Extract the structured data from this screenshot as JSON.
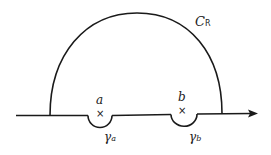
{
  "diagram": {
    "type": "contour-integration-path",
    "colors": {
      "stroke": "#1a1a1a",
      "background": "#ffffff"
    },
    "contour": {
      "name": "C",
      "subscript": "R"
    },
    "points": [
      {
        "label": "a",
        "marker": "×"
      },
      {
        "label": "b",
        "marker": "×"
      }
    ],
    "indentations": [
      {
        "symbol": "γ",
        "subscript": "a"
      },
      {
        "symbol": "γ",
        "subscript": "b"
      }
    ]
  }
}
